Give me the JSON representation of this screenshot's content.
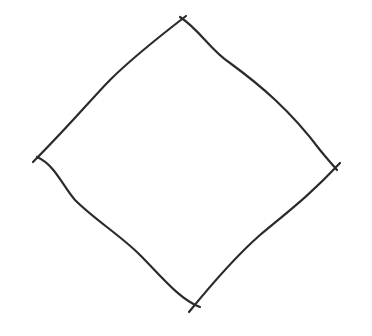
{
  "figure": {
    "shape": "hand-drawn diamond (rotated square)",
    "background": "#ffffff",
    "stroke_color": "#2b2b2b",
    "stroke_width": 2.2,
    "vertices": {
      "top": [
        183,
        19
      ],
      "right": [
        336,
        166
      ],
      "bottom": [
        196,
        306
      ],
      "left": [
        35,
        160
      ]
    },
    "edges": [
      {
        "name": "top-left-edge",
        "d": "M 186 16 C 160 36, 130 60, 110 80 C 95 95, 70 125, 33 162"
      },
      {
        "name": "top-right-edge",
        "d": "M 180 17 C 200 30, 210 50, 230 63 C 260 85, 290 110, 320 150 C 328 160, 333 165, 337 170"
      },
      {
        "name": "bottom-right-edge",
        "d": "M 340 163 C 310 195, 290 210, 260 235 C 235 257, 215 280, 189 312"
      },
      {
        "name": "bottom-left-edge",
        "d": "M 37 157 C 55 165, 62 185, 75 200 C 95 220, 120 235, 140 255 C 160 275, 180 300, 200 307"
      }
    ]
  }
}
